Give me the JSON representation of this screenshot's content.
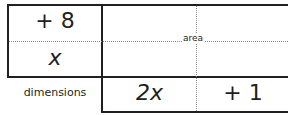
{
  "left_column": {
    "top_factor": "+ 8",
    "bottom_factor": "x",
    "label": "dimensions"
  },
  "bottom_row": {
    "left_factor": "2x",
    "right_factor": "+ 1"
  },
  "grid": {
    "center_label": "area"
  },
  "colors": {
    "line": "#231f20",
    "dotted": "#8a8a8a"
  }
}
